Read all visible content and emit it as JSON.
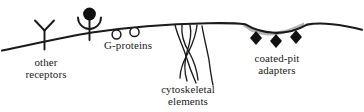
{
  "figure": {
    "type": "cell-membrane-schematic",
    "background_color": "#ffffff",
    "line_color": "#1a1a1a",
    "fill_color": "#111111",
    "shade_color": "#a8a8a8",
    "labels": {
      "other_receptors": {
        "line1": "other",
        "line2": "receptors"
      },
      "g_proteins": {
        "line1": "G-proteins"
      },
      "coated_pit_adapters": {
        "line1": "coated-pit",
        "line2": "adapters"
      },
      "cytoskeletal_elements": {
        "line1": "cytoskeletal",
        "line2": "elements"
      }
    },
    "elements": [
      {
        "name": "plasma-membrane",
        "kind": "curve"
      },
      {
        "name": "y-receptor",
        "kind": "y-shape",
        "count": 1
      },
      {
        "name": "ligand-bound-receptor",
        "kind": "filled-circle-in-cup",
        "count": 1
      },
      {
        "name": "g-protein",
        "kind": "open-circle",
        "count": 2
      },
      {
        "name": "cytoskeletal-filament",
        "kind": "wavy-line",
        "count": 5
      },
      {
        "name": "coated-pit-shading",
        "kind": "shaded-band",
        "count": 1
      },
      {
        "name": "coated-pit-adapter",
        "kind": "filled-diamond",
        "count": 3
      }
    ]
  }
}
